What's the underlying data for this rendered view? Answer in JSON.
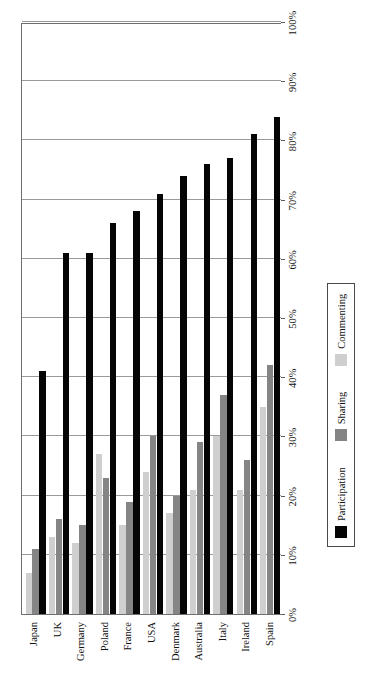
{
  "chart_data": {
    "type": "bar",
    "orientation": "horizontal",
    "title": "",
    "xlabel": "",
    "ylabel": "",
    "xlim": [
      0,
      100
    ],
    "xtick_labels": [
      "0%",
      "10%",
      "20%",
      "30%",
      "40%",
      "50%",
      "60%",
      "70%",
      "80%",
      "90%",
      "100%"
    ],
    "xtick_values": [
      0,
      10,
      20,
      30,
      40,
      50,
      60,
      70,
      80,
      90,
      100
    ],
    "grid": true,
    "legend_position": "bottom",
    "categories": [
      "Japan",
      "UK",
      "Germany",
      "Poland",
      "France",
      "USA",
      "Denmark",
      "Australia",
      "Italy",
      "Ireland",
      "Spain"
    ],
    "series": [
      {
        "name": "Participation",
        "color": "#050505",
        "values": [
          41,
          61,
          61,
          66,
          68,
          71,
          74,
          76,
          77,
          81,
          84
        ]
      },
      {
        "name": "Sharing",
        "color": "#858585",
        "values": [
          11,
          16,
          15,
          23,
          19,
          30,
          20,
          29,
          37,
          26,
          42
        ]
      },
      {
        "name": "Commenting",
        "color": "#cfcfcf",
        "values": [
          7,
          13,
          12,
          27,
          15,
          24,
          17,
          21,
          30,
          21,
          35
        ]
      }
    ]
  },
  "legend": {
    "items": [
      {
        "label": "Participation",
        "color": "#050505"
      },
      {
        "label": "Sharing",
        "color": "#858585"
      },
      {
        "label": "Commenting",
        "color": "#cfcfcf"
      }
    ]
  }
}
